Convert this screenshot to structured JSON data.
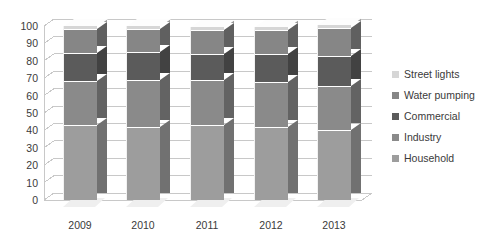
{
  "chart_data": {
    "type": "bar",
    "subtype": "stacked-column-3d",
    "title": "",
    "subtitle": "",
    "xlabel": "",
    "ylabel": "",
    "categories": [
      "2009",
      "2010",
      "2011",
      "2012",
      "2013"
    ],
    "ylim": [
      0,
      100
    ],
    "yticks": [
      0,
      10,
      20,
      30,
      40,
      50,
      60,
      70,
      80,
      90,
      100
    ],
    "ytick_labels": [
      "0",
      "10",
      "20",
      "30",
      "40",
      "50",
      "60",
      "70",
      "80",
      "90",
      "100"
    ],
    "grid": true,
    "grid_axis": "y",
    "legend_position": "right",
    "stack_order_bottom_to_top": [
      "Household",
      "Industry",
      "Commercial",
      "Water pumping",
      "Street lights"
    ],
    "series": [
      {
        "name": "Household",
        "color": "#9d9d9d",
        "values": [
          43,
          42,
          43,
          42,
          40
        ]
      },
      {
        "name": "Industry",
        "color": "#8a8a8a",
        "values": [
          25,
          27,
          26,
          26,
          25
        ]
      },
      {
        "name": "Commercial",
        "color": "#5b5b5b",
        "values": [
          16,
          16,
          15,
          16,
          17
        ]
      },
      {
        "name": "Water pumping",
        "color": "#868686",
        "values": [
          14,
          13,
          14,
          14,
          16
        ]
      },
      {
        "name": "Street lights",
        "color": "#d6d6d6",
        "values": [
          2,
          2,
          2,
          2,
          2
        ]
      }
    ]
  },
  "legend": {
    "items": [
      {
        "label": "Street lights",
        "color": "#d6d6d6"
      },
      {
        "label": "Water pumping",
        "color": "#868686"
      },
      {
        "label": "Commercial",
        "color": "#5b5b5b"
      },
      {
        "label": "Industry",
        "color": "#8a8a8a"
      },
      {
        "label": "Household",
        "color": "#9d9d9d"
      }
    ]
  },
  "axes": {
    "y_tick_labels": [
      "100",
      "90",
      "80",
      "70",
      "60",
      "50",
      "40",
      "30",
      "20",
      "10",
      "0"
    ],
    "x_tick_labels": [
      "2009",
      "2010",
      "2011",
      "2012",
      "2013"
    ]
  },
  "style": {
    "background": "#ffffff",
    "gridline_color": "#c8c8c8",
    "axis_text_color": "#3a3a3a"
  }
}
